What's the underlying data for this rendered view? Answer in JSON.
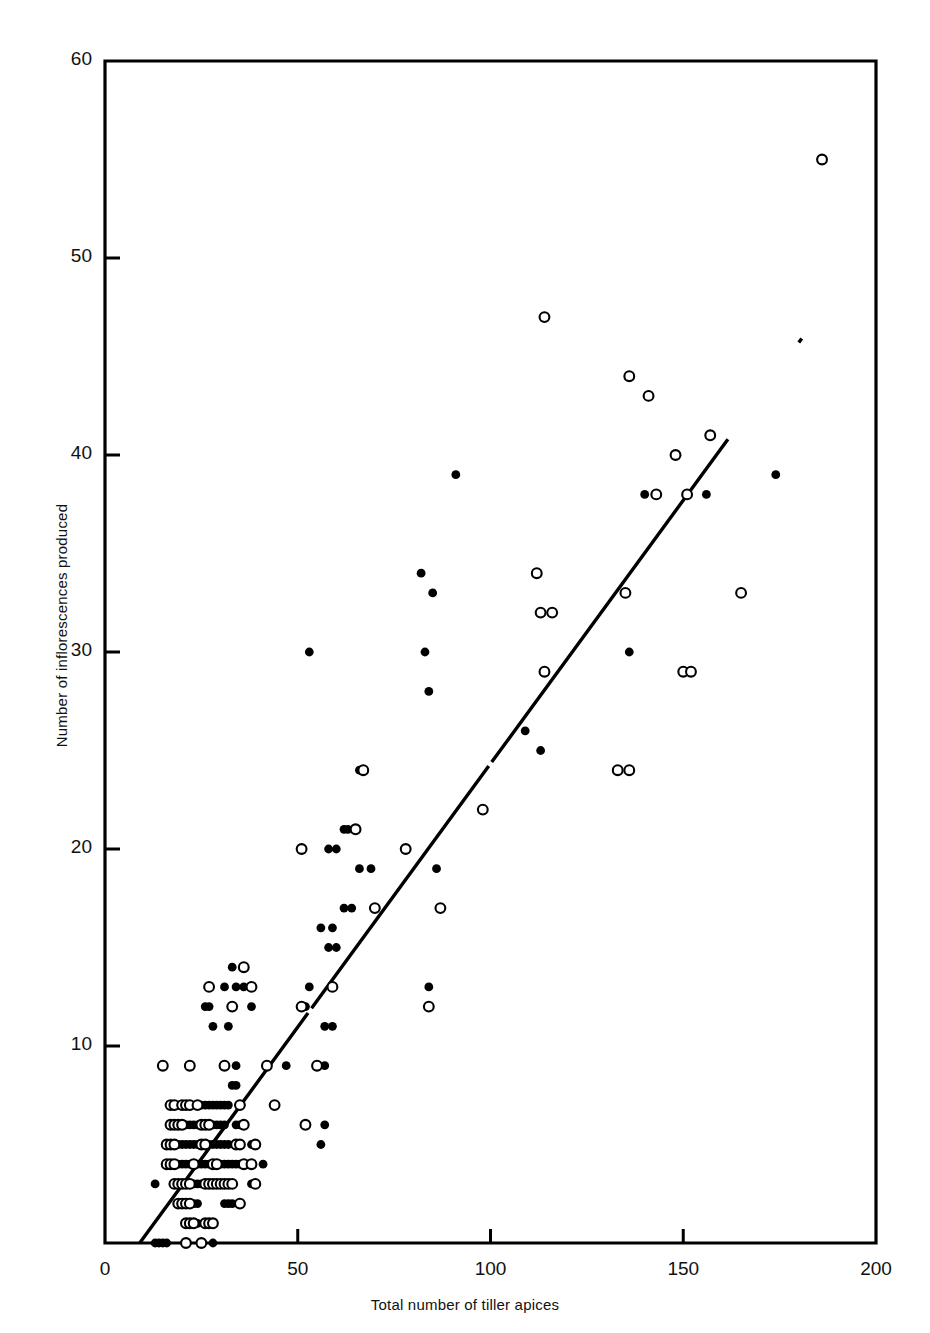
{
  "chart_data": {
    "type": "scatter",
    "title": "",
    "xlabel": "Total number of tiller apices",
    "ylabel": "Number of inflorescences produced",
    "xlim": [
      0,
      200
    ],
    "ylim": [
      0,
      60
    ],
    "xticks": [
      0,
      50,
      100,
      150,
      200
    ],
    "yticks": [
      0,
      10,
      20,
      30,
      40,
      50,
      60
    ],
    "xtick_labels": [
      "0",
      "50",
      "100",
      "150",
      "200"
    ],
    "ytick_labels": [
      "10",
      "20",
      "30",
      "40",
      "50",
      "60"
    ],
    "grid": false,
    "legend": "none",
    "series": [
      {
        "name": "filled",
        "marker": "filled-circle",
        "color": "#000000",
        "points": [
          [
            13,
            0
          ],
          [
            14,
            0
          ],
          [
            15,
            0
          ],
          [
            16,
            0
          ],
          [
            28,
            0
          ],
          [
            22,
            1
          ],
          [
            23,
            1
          ],
          [
            24,
            1
          ],
          [
            27,
            1
          ],
          [
            21,
            2
          ],
          [
            22,
            2
          ],
          [
            23,
            2
          ],
          [
            24,
            2
          ],
          [
            31,
            2
          ],
          [
            32,
            2
          ],
          [
            33,
            2
          ],
          [
            13,
            3
          ],
          [
            20,
            3
          ],
          [
            23,
            3
          ],
          [
            24,
            3
          ],
          [
            25,
            3
          ],
          [
            30,
            3
          ],
          [
            31,
            3
          ],
          [
            38,
            3
          ],
          [
            19,
            4
          ],
          [
            20,
            4
          ],
          [
            21,
            4
          ],
          [
            22,
            4
          ],
          [
            23,
            4
          ],
          [
            24,
            4
          ],
          [
            25,
            4
          ],
          [
            26,
            4
          ],
          [
            27,
            4
          ],
          [
            28,
            4
          ],
          [
            29,
            4
          ],
          [
            30,
            4
          ],
          [
            31,
            4
          ],
          [
            32,
            4
          ],
          [
            33,
            4
          ],
          [
            34,
            4
          ],
          [
            35,
            4
          ],
          [
            36,
            4
          ],
          [
            37,
            4
          ],
          [
            41,
            4
          ],
          [
            19,
            5
          ],
          [
            20,
            5
          ],
          [
            21,
            5
          ],
          [
            22,
            5
          ],
          [
            23,
            5
          ],
          [
            24,
            5
          ],
          [
            25,
            5
          ],
          [
            26,
            5
          ],
          [
            27,
            5
          ],
          [
            28,
            5
          ],
          [
            29,
            5
          ],
          [
            30,
            5
          ],
          [
            31,
            5
          ],
          [
            32,
            5
          ],
          [
            38,
            5
          ],
          [
            56,
            5
          ],
          [
            18,
            6
          ],
          [
            19,
            6
          ],
          [
            21,
            6
          ],
          [
            22,
            6
          ],
          [
            23,
            6
          ],
          [
            24,
            6
          ],
          [
            26,
            6
          ],
          [
            27,
            6
          ],
          [
            28,
            6
          ],
          [
            29,
            6
          ],
          [
            30,
            6
          ],
          [
            31,
            6
          ],
          [
            34,
            6
          ],
          [
            35,
            6
          ],
          [
            57,
            6
          ],
          [
            18,
            7
          ],
          [
            19,
            7
          ],
          [
            22,
            7
          ],
          [
            25,
            7
          ],
          [
            26,
            7
          ],
          [
            27,
            7
          ],
          [
            28,
            7
          ],
          [
            29,
            7
          ],
          [
            30,
            7
          ],
          [
            31,
            7
          ],
          [
            32,
            7
          ],
          [
            33,
            8
          ],
          [
            34,
            8
          ],
          [
            34,
            9
          ],
          [
            47,
            9
          ],
          [
            57,
            9
          ],
          [
            28,
            11
          ],
          [
            32,
            11
          ],
          [
            57,
            11
          ],
          [
            59,
            11
          ],
          [
            26,
            12
          ],
          [
            27,
            12
          ],
          [
            38,
            12
          ],
          [
            52,
            12
          ],
          [
            84,
            13
          ],
          [
            31,
            13
          ],
          [
            34,
            13
          ],
          [
            36,
            13
          ],
          [
            53,
            13
          ],
          [
            33,
            14
          ],
          [
            58,
            15
          ],
          [
            60,
            15
          ],
          [
            59,
            16
          ],
          [
            56,
            16
          ],
          [
            62,
            17
          ],
          [
            64,
            17
          ],
          [
            66,
            19
          ],
          [
            69,
            19
          ],
          [
            86,
            19
          ],
          [
            58,
            20
          ],
          [
            60,
            20
          ],
          [
            62,
            21
          ],
          [
            63,
            21
          ],
          [
            66,
            24
          ],
          [
            113,
            25
          ],
          [
            109,
            26
          ],
          [
            84,
            28
          ],
          [
            53,
            30
          ],
          [
            83,
            30
          ],
          [
            136,
            30
          ],
          [
            85,
            33
          ],
          [
            82,
            34
          ],
          [
            140,
            38
          ],
          [
            156,
            38
          ],
          [
            91,
            39
          ],
          [
            174,
            39
          ]
        ]
      },
      {
        "name": "open",
        "marker": "open-circle",
        "color": "#000000",
        "points": [
          [
            21,
            0
          ],
          [
            25,
            0
          ],
          [
            21,
            1
          ],
          [
            22,
            1
          ],
          [
            23,
            1
          ],
          [
            26,
            1
          ],
          [
            27,
            1
          ],
          [
            28,
            1
          ],
          [
            19,
            2
          ],
          [
            20,
            2
          ],
          [
            21,
            2
          ],
          [
            22,
            2
          ],
          [
            35,
            2
          ],
          [
            18,
            3
          ],
          [
            19,
            3
          ],
          [
            20,
            3
          ],
          [
            21,
            3
          ],
          [
            22,
            3
          ],
          [
            26,
            3
          ],
          [
            27,
            3
          ],
          [
            28,
            3
          ],
          [
            29,
            3
          ],
          [
            30,
            3
          ],
          [
            31,
            3
          ],
          [
            32,
            3
          ],
          [
            33,
            3
          ],
          [
            39,
            3
          ],
          [
            16,
            4
          ],
          [
            17,
            4
          ],
          [
            18,
            4
          ],
          [
            23,
            4
          ],
          [
            28,
            4
          ],
          [
            29,
            4
          ],
          [
            36,
            4
          ],
          [
            38,
            4
          ],
          [
            16,
            5
          ],
          [
            17,
            5
          ],
          [
            18,
            5
          ],
          [
            25,
            5
          ],
          [
            26,
            5
          ],
          [
            34,
            5
          ],
          [
            35,
            5
          ],
          [
            39,
            5
          ],
          [
            17,
            6
          ],
          [
            18,
            6
          ],
          [
            19,
            6
          ],
          [
            20,
            6
          ],
          [
            25,
            6
          ],
          [
            26,
            6
          ],
          [
            27,
            6
          ],
          [
            36,
            6
          ],
          [
            52,
            6
          ],
          [
            17,
            7
          ],
          [
            18,
            7
          ],
          [
            20,
            7
          ],
          [
            21,
            7
          ],
          [
            22,
            7
          ],
          [
            24,
            7
          ],
          [
            35,
            7
          ],
          [
            44,
            7
          ],
          [
            15,
            9
          ],
          [
            22,
            9
          ],
          [
            31,
            9
          ],
          [
            42,
            9
          ],
          [
            55,
            9
          ],
          [
            33,
            12
          ],
          [
            51,
            12
          ],
          [
            84,
            12
          ],
          [
            27,
            13
          ],
          [
            38,
            13
          ],
          [
            59,
            13
          ],
          [
            36,
            14
          ],
          [
            70,
            17
          ],
          [
            87,
            17
          ],
          [
            51,
            20
          ],
          [
            78,
            20
          ],
          [
            65,
            21
          ],
          [
            98,
            22
          ],
          [
            67,
            24
          ],
          [
            133,
            24
          ],
          [
            136,
            24
          ],
          [
            114,
            29
          ],
          [
            150,
            29
          ],
          [
            152,
            29
          ],
          [
            116,
            32
          ],
          [
            113,
            32
          ],
          [
            135,
            33
          ],
          [
            165,
            33
          ],
          [
            112,
            34
          ],
          [
            143,
            38
          ],
          [
            151,
            38
          ],
          [
            148,
            40
          ],
          [
            157,
            41
          ],
          [
            141,
            43
          ],
          [
            136,
            44
          ],
          [
            114,
            47
          ],
          [
            186,
            55
          ]
        ]
      }
    ],
    "fit_line": {
      "label": "regression-line",
      "style": "solid-with-small-gaps",
      "x_start": 9,
      "y_start": 0,
      "x_end": 196,
      "y_end": 50
    }
  }
}
